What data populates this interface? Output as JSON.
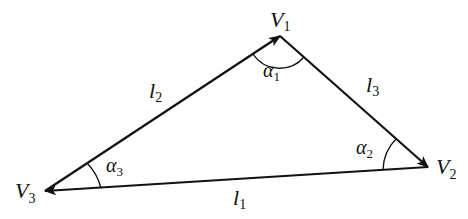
{
  "diagram": {
    "type": "vector triangle",
    "vertices": [
      {
        "id": "V1",
        "label": "V",
        "sub": "1",
        "x": 280,
        "y": 36
      },
      {
        "id": "V2",
        "label": "V",
        "sub": "2",
        "x": 428,
        "y": 167
      },
      {
        "id": "V3",
        "label": "V",
        "sub": "3",
        "x": 45,
        "y": 191
      }
    ],
    "edges": [
      {
        "id": "l1",
        "label": "l",
        "sub": "1",
        "from": "V2",
        "to": "V3"
      },
      {
        "id": "l2",
        "label": "l",
        "sub": "2",
        "from": "V3",
        "to": "V1"
      },
      {
        "id": "l3",
        "label": "l",
        "sub": "3",
        "from": "V1",
        "to": "V2"
      }
    ],
    "angles": [
      {
        "id": "alpha1",
        "label": "α",
        "sub": "1",
        "at": "V1"
      },
      {
        "id": "alpha2",
        "label": "α",
        "sub": "2",
        "at": "V2"
      },
      {
        "id": "alpha3",
        "label": "α",
        "sub": "3",
        "at": "V3"
      }
    ]
  },
  "labels": {
    "V1": {
      "main": "V",
      "sub": "1"
    },
    "V2": {
      "main": "V",
      "sub": "2"
    },
    "V3": {
      "main": "V",
      "sub": "3"
    },
    "l1": {
      "main": "l",
      "sub": "1"
    },
    "l2": {
      "main": "l",
      "sub": "2"
    },
    "l3": {
      "main": "l",
      "sub": "3"
    },
    "a1": {
      "main": "α",
      "sub": "1"
    },
    "a2": {
      "main": "α",
      "sub": "2"
    },
    "a3": {
      "main": "α",
      "sub": "3"
    }
  }
}
